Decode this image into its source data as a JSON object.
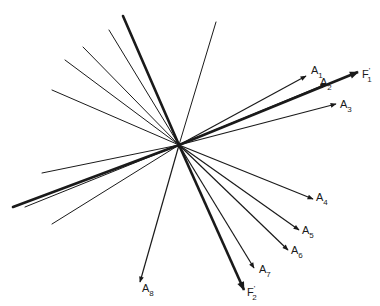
{
  "diagram": {
    "type": "vector-star",
    "origin": [
      179,
      145
    ],
    "colors": {
      "stroke": "#1a1a1a",
      "background": "#ffffff"
    },
    "arrows": [
      {
        "id": "A1",
        "label": "A",
        "sub": "1",
        "prime": "",
        "end": [
          306,
          76
        ],
        "width": 1.2,
        "label_pos": [
          311,
          74
        ]
      },
      {
        "id": "A2",
        "label": "A",
        "sub": "2",
        "prime": "",
        "end": [
          326,
          84
        ],
        "width": 1.2,
        "label_pos": [
          320,
          86
        ]
      },
      {
        "id": "F1p",
        "label": "F",
        "sub": "1",
        "prime": "'",
        "end": [
          358,
          72
        ],
        "width": 2.6,
        "label_pos": [
          362,
          78
        ]
      },
      {
        "id": "A3",
        "label": "A",
        "sub": "3",
        "prime": "",
        "end": [
          336,
          104
        ],
        "width": 1.2,
        "label_pos": [
          340,
          108
        ]
      },
      {
        "id": "A4",
        "label": "A",
        "sub": "4",
        "prime": "",
        "end": [
          313,
          199
        ],
        "width": 1.2,
        "label_pos": [
          316,
          201
        ]
      },
      {
        "id": "A5",
        "label": "A",
        "sub": "5",
        "prime": "",
        "end": [
          299,
          230
        ],
        "width": 1.2,
        "label_pos": [
          302,
          234
        ]
      },
      {
        "id": "A6",
        "label": "A",
        "sub": "6",
        "prime": "",
        "end": [
          288,
          250
        ],
        "width": 1.2,
        "label_pos": [
          291,
          254
        ]
      },
      {
        "id": "A7",
        "label": "A",
        "sub": "7",
        "prime": "",
        "end": [
          254,
          268
        ],
        "width": 1.2,
        "label_pos": [
          259,
          273
        ]
      },
      {
        "id": "F2p",
        "label": "F",
        "sub": "2",
        "prime": "'",
        "end": [
          244,
          290
        ],
        "width": 2.6,
        "label_pos": [
          247,
          296
        ]
      },
      {
        "id": "A8",
        "label": "A",
        "sub": "8",
        "prime": "",
        "end": [
          140,
          282
        ],
        "width": 1.2,
        "label_pos": [
          142,
          292
        ]
      }
    ],
    "lines": [
      {
        "end": [
          123,
          16
        ],
        "width": 2.6
      },
      {
        "end": [
          109,
          30
        ],
        "width": 1.0
      },
      {
        "end": [
          83,
          47
        ],
        "width": 1.0
      },
      {
        "end": [
          65,
          60
        ],
        "width": 1.0
      },
      {
        "end": [
          52,
          90
        ],
        "width": 1.0
      },
      {
        "end": [
          216,
          22
        ],
        "width": 1.0
      },
      {
        "end": [
          42,
          173
        ],
        "width": 1.0
      },
      {
        "end": [
          13,
          207
        ],
        "width": 2.6
      },
      {
        "end": [
          25,
          207
        ],
        "width": 1.0
      },
      {
        "end": [
          52,
          224
        ],
        "width": 1.0
      }
    ]
  }
}
